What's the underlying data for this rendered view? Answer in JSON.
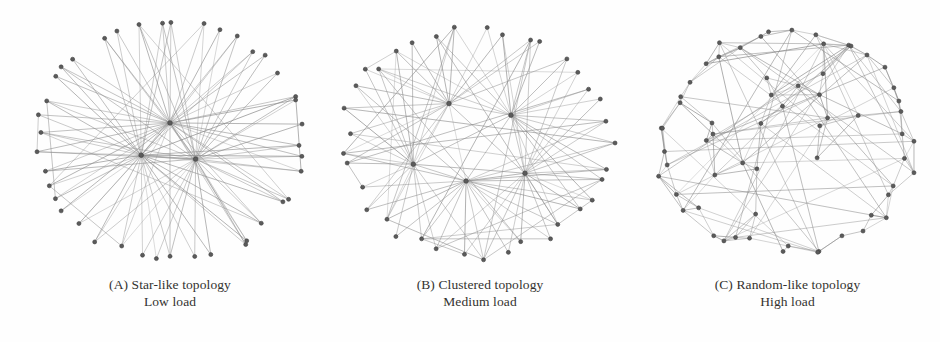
{
  "figure": {
    "background_color": "#fefefe",
    "node_color": "#5b5b5b",
    "node_stroke_color": "#3f3f3f",
    "edge_color": "#8d8d8d",
    "caption_color": "#33322f"
  },
  "panels": [
    {
      "id": "a",
      "label": "(A) Star-like topology",
      "load": "Low load",
      "topology_type": "star",
      "node_count": 44,
      "hub_count": 3,
      "description": "Few high-degree hub nodes at the centre with a dense ring of leaf nodes"
    },
    {
      "id": "b",
      "label": "(B) Clustered topology",
      "load": "Medium load",
      "topology_type": "clustered",
      "node_count": 42,
      "hub_count": 5,
      "description": "Several medium-degree cluster heads distributed through the interior"
    },
    {
      "id": "c",
      "label": "(C) Random-like topology",
      "load": "High load",
      "topology_type": "random",
      "node_count": 45,
      "hub_count": 0,
      "description": "Uniform mesh with evenly distributed node degree"
    }
  ],
  "chart_data": {
    "type": "diagram",
    "subtype": "node-link-graph",
    "title": "",
    "panel_count": 3,
    "graphs": [
      {
        "panel": "A",
        "name": "Star-like topology",
        "load_level": "Low",
        "hubs": [
          {
            "x": 0.5,
            "y": 0.43
          },
          {
            "x": 0.41,
            "y": 0.555
          },
          {
            "x": 0.58,
            "y": 0.57
          }
        ],
        "ring_nodes": 41,
        "ring_radius_x": 0.43,
        "ring_radius_y": 0.47,
        "ring_center": {
          "x": 0.5,
          "y": 0.5
        },
        "ring_jitter": 0.055,
        "edges_per_leaf": 2,
        "extra_ring_links": 7
      },
      {
        "panel": "B",
        "name": "Clustered topology",
        "load_level": "Medium",
        "hubs": [
          {
            "x": 0.4,
            "y": 0.355
          },
          {
            "x": 0.6,
            "y": 0.4
          },
          {
            "x": 0.285,
            "y": 0.59
          },
          {
            "x": 0.455,
            "y": 0.655
          },
          {
            "x": 0.645,
            "y": 0.625
          }
        ],
        "ring_nodes": 37,
        "ring_radius_x": 0.45,
        "ring_radius_y": 0.455,
        "ring_center": {
          "x": 0.49,
          "y": 0.5
        },
        "ring_jitter": 0.09,
        "edges_per_leaf": 2,
        "extra_ring_links": 22
      },
      {
        "panel": "C",
        "name": "Random-like topology",
        "load_level": "High",
        "hubs": [],
        "ring_nodes": 45,
        "ring_radius_x": 0.44,
        "ring_radius_y": 0.45,
        "ring_center": {
          "x": 0.5,
          "y": 0.5
        },
        "ring_jitter": 0.15,
        "interior_nodes": 18,
        "mean_degree": 5,
        "extra_ring_links": 62
      }
    ]
  }
}
